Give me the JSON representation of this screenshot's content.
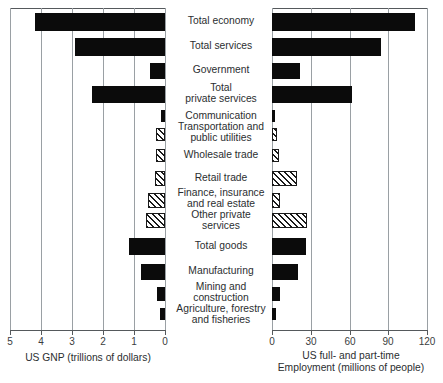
{
  "chart_data": {
    "type": "bar",
    "orientation": "horizontal",
    "layout": "back-to-back paired panels sharing centered category labels",
    "title": "",
    "categories": [
      "Total economy",
      "Total services",
      "Government",
      "Total private services",
      "Communication",
      "Transportation and public utilities",
      "Wholesale trade",
      "Retail trade",
      "Finance, insurance and real estate",
      "Other private services",
      "Total goods",
      "Manufacturing",
      "Mining and construction",
      "Agriculture, forestry and fisheries"
    ],
    "category_lines": [
      [
        "Total economy"
      ],
      [
        "Total services"
      ],
      [
        "Government"
      ],
      [
        "Total",
        "private services"
      ],
      [
        "Communication"
      ],
      [
        "Transportation and",
        "public utilities"
      ],
      [
        "Wholesale trade"
      ],
      [
        "Retail trade"
      ],
      [
        "Finance, insurance",
        "and real estate"
      ],
      [
        "Other private",
        "services"
      ],
      [
        "Total goods"
      ],
      [
        "Manufacturing"
      ],
      [
        "Mining and",
        "construction"
      ],
      [
        "Agriculture, forestry",
        "and fisheries"
      ]
    ],
    "series": [
      {
        "name": "US GNP (trillions of dollars)",
        "panel": "left",
        "direction": "right-to-left",
        "xlabel": "US GNP (trillions of dollars)",
        "xlabel_lines": [
          "US GNP (trillions of dollars)"
        ],
        "xlim": [
          5,
          0
        ],
        "ticks": [
          5,
          4,
          3,
          2,
          1,
          0
        ],
        "tick_labels": [
          "5",
          "4",
          "3",
          "2",
          "1",
          "0"
        ],
        "values": [
          4.2,
          2.9,
          0.48,
          2.35,
          0.13,
          0.28,
          0.3,
          0.33,
          0.55,
          0.6,
          1.15,
          0.78,
          0.25,
          0.17
        ],
        "fills": [
          "solid",
          "solid",
          "solid",
          "solid",
          "solid",
          "hatch",
          "hatch",
          "hatch",
          "hatch",
          "hatch",
          "solid",
          "solid",
          "solid",
          "solid"
        ]
      },
      {
        "name": "US full- and part-time Employment (millions of people)",
        "panel": "right",
        "direction": "left-to-right",
        "xlabel": "US full- and part-time Employment (millions of people)",
        "xlabel_lines": [
          "US full- and part-time",
          "Employment (millions of people)"
        ],
        "xlim": [
          0,
          120
        ],
        "ticks": [
          0,
          30,
          60,
          90,
          120
        ],
        "tick_labels": [
          "0",
          "30",
          "60",
          "90",
          "120"
        ],
        "values": [
          111,
          84,
          22,
          62,
          2.5,
          3.5,
          5.5,
          19,
          6.5,
          27,
          26,
          20,
          6,
          3
        ],
        "fills": [
          "solid",
          "solid",
          "solid",
          "solid",
          "solid",
          "hatch",
          "hatch",
          "hatch",
          "hatch",
          "hatch",
          "solid",
          "solid",
          "solid",
          "solid"
        ]
      }
    ],
    "grid": true,
    "legend": null,
    "colors": {
      "solid_bar": "#0b0b0b",
      "hatch_stroke": "#1a1a1a",
      "gridline": "#9aa0a4",
      "axis": "#55595c",
      "text": "#2b2e30",
      "background": "#ffffff"
    }
  }
}
